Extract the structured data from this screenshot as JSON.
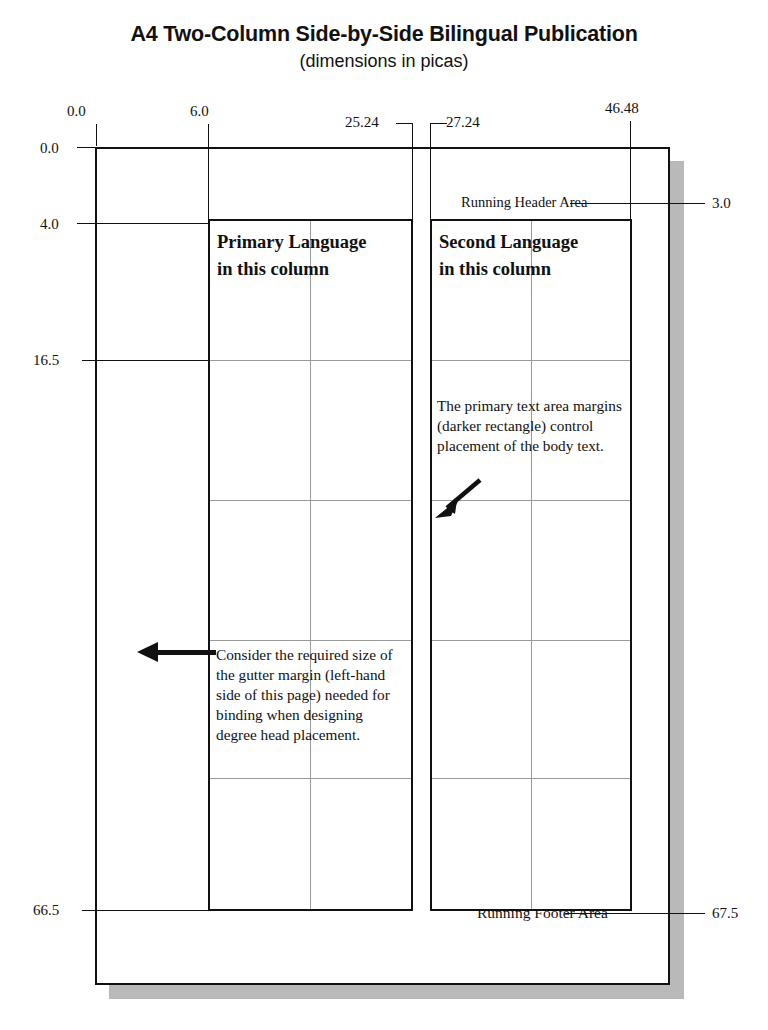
{
  "title": {
    "main": "A4 Two-Column Side-by-Side Bilingual Publication",
    "sub": "(dimensions in picas)"
  },
  "units": "picas",
  "measurements": {
    "top": [
      {
        "name": "page-left-edge",
        "label": "0.0"
      },
      {
        "name": "column-one-left",
        "label": "6.0"
      },
      {
        "name": "column-one-right",
        "label": "25.24"
      },
      {
        "name": "column-two-left",
        "label": "27.24"
      },
      {
        "name": "column-two-right",
        "label": "46.48"
      }
    ],
    "left": [
      {
        "name": "page-top-edge",
        "label": "0.0"
      },
      {
        "name": "text-area-top",
        "label": "4.0"
      },
      {
        "name": "grid-line-mid",
        "label": "16.5"
      },
      {
        "name": "text-area-bottom",
        "label": "66.5"
      }
    ],
    "right": [
      {
        "name": "running-header-baseline",
        "label": "3.0"
      },
      {
        "name": "running-footer-baseline",
        "label": "67.5"
      }
    ]
  },
  "page": {
    "header_label": "Running Header Area",
    "footer_label": "Running Footer Area",
    "columns": [
      {
        "id": "primary",
        "heading_line_1": "Primary Language",
        "heading_line_2": "in this column",
        "body": "Consider the required size of  the gutter margin (left-hand side of this page) needed for binding when designing degree head placement."
      },
      {
        "id": "second",
        "heading_line_1": "Second Language",
        "heading_line_2": "in this column",
        "body": "The primary text area margins (darker rectangle) control placement of the body text."
      }
    ]
  },
  "annotations": {
    "gutter_arrow": "gutter-margin-arrow",
    "text_area_arrow": "text-area-margin-arrow"
  },
  "colors": {
    "ink": "#111111",
    "grid": "#9a9a9a",
    "shadow": "#b9b9b9",
    "paper": "#ffffff"
  }
}
